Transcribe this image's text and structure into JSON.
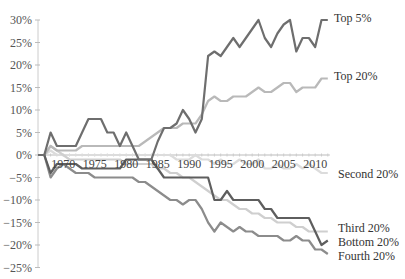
{
  "chart_data": {
    "type": "line",
    "title": "",
    "xlabel": "",
    "ylabel": "",
    "ylim": [
      -25,
      30
    ],
    "xlim": [
      1966,
      2012
    ],
    "grid": false,
    "legend_position": "inline-right",
    "y_ticks": [
      "30%",
      "25%",
      "20%",
      "15%",
      "10%",
      "5%",
      "0%",
      "-5%",
      "-10%",
      "-15%",
      "-20%",
      "-25%"
    ],
    "y_tick_values": [
      30,
      25,
      20,
      15,
      10,
      5,
      0,
      -5,
      -10,
      -15,
      -20,
      -25
    ],
    "x_ticks": [
      "1970",
      "1975",
      "1980",
      "1985",
      "1990",
      "1995",
      "2000",
      "2005",
      "2010"
    ],
    "x_tick_values": [
      1970,
      1975,
      1980,
      1985,
      1990,
      1995,
      2000,
      2005,
      2010
    ],
    "x": [
      1967,
      1968,
      1969,
      1970,
      1971,
      1972,
      1973,
      1974,
      1975,
      1976,
      1977,
      1978,
      1979,
      1980,
      1981,
      1982,
      1983,
      1984,
      1985,
      1986,
      1987,
      1988,
      1989,
      1990,
      1991,
      1992,
      1993,
      1994,
      1995,
      1996,
      1997,
      1998,
      1999,
      2000,
      2001,
      2002,
      2003,
      2004,
      2005,
      2006,
      2007,
      2008,
      2009,
      2010,
      2011,
      2012
    ],
    "series": [
      {
        "name": "Top 5%",
        "label": "Top 5%",
        "color": "#6e6e6e",
        "width": 2.2,
        "values": [
          0,
          5,
          2,
          2,
          2,
          2,
          5,
          8,
          8,
          8,
          5,
          5,
          2,
          5,
          2,
          -1,
          -1,
          -1,
          3,
          6,
          6,
          7,
          10,
          8,
          5,
          8,
          22,
          23,
          22,
          24,
          26,
          24,
          26,
          28,
          30,
          26,
          24,
          27,
          29,
          30,
          23,
          26,
          26,
          24,
          30,
          30
        ]
      },
      {
        "name": "Top 20%",
        "label": "Top 20%",
        "color": "#b9b9b9",
        "width": 2.2,
        "values": [
          0,
          2,
          1,
          1,
          1,
          1,
          2,
          2,
          2,
          2,
          2,
          2,
          2,
          2,
          2,
          2,
          3,
          4,
          5,
          6,
          6,
          6,
          7,
          7,
          7,
          9,
          12,
          13,
          12,
          12,
          13,
          13,
          13,
          14,
          15,
          14,
          14,
          15,
          16,
          16,
          14,
          15,
          15,
          15,
          17,
          17
        ]
      },
      {
        "name": "Second 20%",
        "label": "Second 20%",
        "color": "#dcdcdc",
        "width": 2.2,
        "values": [
          0,
          1,
          0,
          0,
          0,
          0,
          0,
          0,
          0,
          0,
          0,
          0,
          0,
          0,
          0,
          0,
          0,
          0,
          0,
          0,
          0,
          -1,
          -1,
          -1,
          0,
          -1,
          -1,
          -2,
          -1,
          -2,
          -2,
          -1,
          -2,
          -2,
          -1,
          -3,
          -3,
          -2,
          -3,
          -3,
          -2,
          -3,
          -2,
          -3,
          -4,
          -4
        ]
      },
      {
        "name": "Third 20%",
        "label": "Third 20%",
        "color": "#cfcfcf",
        "width": 2.2,
        "values": [
          0,
          2,
          1,
          0,
          -1,
          -1,
          -1,
          -1,
          -1,
          -1,
          -1,
          -1,
          -1,
          -2,
          -2,
          -2,
          -2,
          -2,
          -3,
          -3,
          -4,
          -4,
          -5,
          -5,
          -6,
          -7,
          -8,
          -9,
          -10,
          -10,
          -11,
          -12,
          -12,
          -13,
          -13,
          -14,
          -14,
          -15,
          -15,
          -15,
          -16,
          -16,
          -17,
          -17,
          -17,
          -17
        ]
      },
      {
        "name": "Bottom 20%",
        "label": "Bottom 20%",
        "color": "#5e5e5e",
        "width": 2.2,
        "values": [
          0,
          -4,
          -2,
          -2,
          -2,
          -2,
          -3,
          -3,
          -3,
          -3,
          -3,
          -3,
          -3,
          -1,
          -1,
          -1,
          -1,
          -1,
          -3,
          -5,
          -5,
          -5,
          -5,
          -5,
          -5,
          -5,
          -5,
          -10,
          -10,
          -8,
          -10,
          -10,
          -10,
          -10,
          -10,
          -12,
          -12,
          -14,
          -14,
          -14,
          -14,
          -14,
          -14,
          -17,
          -20,
          -19
        ]
      },
      {
        "name": "Fourth 20%",
        "label": "Fourth 20%",
        "color": "#8c8c8c",
        "width": 2.2,
        "values": [
          0,
          -5,
          -3,
          -2,
          -3,
          -4,
          -4,
          -4,
          -5,
          -5,
          -5,
          -5,
          -5,
          -5,
          -5,
          -6,
          -6,
          -7,
          -8,
          -9,
          -10,
          -10,
          -11,
          -10,
          -10,
          -12,
          -15,
          -17,
          -15,
          -16,
          -17,
          -16,
          -17,
          -17,
          -18,
          -18,
          -18,
          -18,
          -19,
          -19,
          -18,
          -19,
          -19,
          -21,
          -21,
          -22
        ]
      }
    ]
  }
}
